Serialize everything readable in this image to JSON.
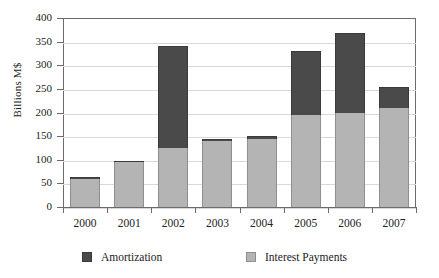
{
  "chart_data": {
    "type": "bar",
    "stacked": true,
    "title": "",
    "xlabel": "",
    "ylabel": "Billions M$",
    "categories": [
      "2000",
      "2001",
      "2002",
      "2003",
      "2004",
      "2005",
      "2006",
      "2007"
    ],
    "series": [
      {
        "name": "Interest Payments",
        "color": "#b4b4b4",
        "values": [
          60,
          95,
          125,
          140,
          145,
          195,
          200,
          210
        ]
      },
      {
        "name": "Amortization",
        "color": "#4a4a4a",
        "values": [
          3,
          3,
          215,
          5,
          5,
          135,
          168,
          45
        ]
      }
    ],
    "totals": [
      63,
      98,
      340,
      145,
      150,
      330,
      368,
      255
    ],
    "ylim": [
      0,
      400
    ],
    "yticks": [
      0,
      50,
      100,
      150,
      200,
      250,
      300,
      350,
      400
    ],
    "ytick_labels": [
      "0",
      "50",
      "100",
      "150",
      "200",
      "250",
      "300",
      "350",
      "400"
    ],
    "grid": true,
    "grid_axis": "y",
    "legend_position": "bottom"
  },
  "legend": {
    "items": [
      {
        "label": "Amortization",
        "swatch": "dark-gray-swatch"
      },
      {
        "label": "Interest Payments",
        "swatch": "light-gray-swatch"
      }
    ]
  },
  "axis": {
    "y_title": "Billions M$"
  }
}
